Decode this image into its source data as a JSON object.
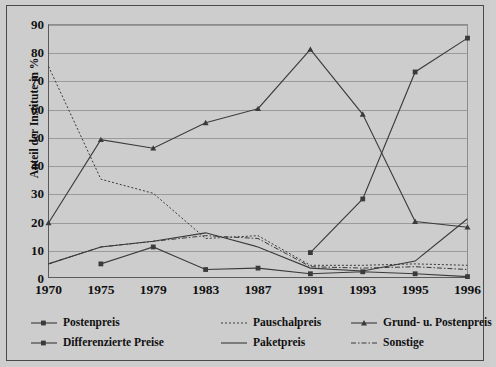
{
  "chart_data": {
    "type": "line",
    "title": "",
    "xlabel": "",
    "ylabel": "Anteil der Institute in %",
    "categories": [
      "1970",
      "1975",
      "1979",
      "1983",
      "1987",
      "1991",
      "1993",
      "1995",
      "1996"
    ],
    "x": [
      1970,
      1975,
      1979,
      1983,
      1987,
      1991,
      1993,
      1995,
      1996
    ],
    "ylim": [
      0,
      90
    ],
    "yticks": [
      0,
      10,
      20,
      30,
      40,
      50,
      60,
      70,
      80,
      90
    ],
    "grid": true,
    "legend_position": "bottom",
    "series": [
      {
        "name": "Postenpreis",
        "marker": "square",
        "line_style": "solid",
        "values": [
          null,
          null,
          null,
          null,
          null,
          9,
          28,
          73,
          85
        ]
      },
      {
        "name": "Pauschalpreis",
        "marker": "none",
        "line_style": "dotted",
        "values": [
          75,
          35,
          30,
          14,
          15,
          4.5,
          4.5,
          5,
          4.5
        ]
      },
      {
        "name": "Grund- u. Postenpreis",
        "marker": "triangle",
        "line_style": "solid",
        "values": [
          19.5,
          49,
          46,
          55,
          60,
          81,
          58,
          20,
          18
        ]
      },
      {
        "name": "Differenzierte Preise",
        "marker": "square",
        "line_style": "solid",
        "values": [
          null,
          5,
          11,
          3,
          3.5,
          1.5,
          2.2,
          1.5,
          0.5
        ]
      },
      {
        "name": "Paketpreis",
        "marker": "none",
        "line_style": "solid",
        "values": [
          5,
          11,
          13,
          16,
          11,
          3.5,
          2.5,
          6,
          21
        ]
      },
      {
        "name": "Sonstige",
        "marker": "none",
        "line_style": "dashdot",
        "values": [
          5,
          11,
          13,
          15,
          14,
          4,
          3.5,
          4,
          3
        ]
      }
    ]
  },
  "axis": {
    "y_title": "Anteil der Institute in %",
    "y_ticks": [
      "90",
      "80",
      "70",
      "60",
      "50",
      "40",
      "30",
      "20",
      "10",
      "0"
    ],
    "x_ticks": [
      "1970",
      "1975",
      "1979",
      "1983",
      "1987",
      "1991",
      "1993",
      "1995",
      "1996"
    ]
  },
  "legend": {
    "items": [
      {
        "label": "Postenpreis",
        "style": "solid-square"
      },
      {
        "label": "Pauschalpreis",
        "style": "dotted"
      },
      {
        "label": "Grund- u. Postenpreis",
        "style": "solid-triangle"
      },
      {
        "label": "Differenzierte Preise",
        "style": "solid-square"
      },
      {
        "label": "Paketpreis",
        "style": "solid"
      },
      {
        "label": "Sonstige",
        "style": "dashdot"
      }
    ]
  },
  "colors": {
    "background": "#cdcdcd",
    "frame": "#4a4a4a",
    "grid": "#9a9a9a",
    "line": "#3a3a3a",
    "text": "#111111"
  }
}
